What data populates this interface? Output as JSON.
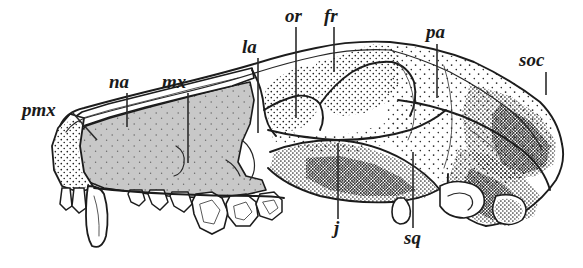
{
  "figure": {
    "kind": "scientific-illustration",
    "background_color": "#ffffff",
    "ink_color": "#1c1c1c",
    "shaded_bone_color": "#c8c8c8",
    "width": 583,
    "height": 268
  },
  "labels": [
    {
      "id": "pmx",
      "text": "pmx",
      "meaning": "premaxilla",
      "text_x": 22,
      "text_y": 116,
      "anchor": "start",
      "font_size": 19,
      "leader": {
        "type": "diagonal",
        "x1": 72,
        "y1": 112,
        "x2": 97,
        "y2": 140
      }
    },
    {
      "id": "na",
      "text": "na",
      "meaning": "nasal",
      "text_x": 109,
      "text_y": 88,
      "anchor": "start",
      "font_size": 19,
      "leader": {
        "type": "vertical",
        "x1": 127,
        "y1": 93,
        "x2": 127,
        "y2": 127
      }
    },
    {
      "id": "mx",
      "text": "mx",
      "meaning": "maxilla",
      "text_x": 162,
      "text_y": 88,
      "anchor": "start",
      "font_size": 19,
      "leader": {
        "type": "vertical",
        "x1": 188,
        "y1": 93,
        "x2": 188,
        "y2": 163
      }
    },
    {
      "id": "la",
      "text": "la",
      "meaning": "lacrimal",
      "text_x": 242,
      "text_y": 53,
      "anchor": "start",
      "font_size": 19,
      "leader": {
        "type": "vertical",
        "x1": 258,
        "y1": 58,
        "x2": 258,
        "y2": 133
      }
    },
    {
      "id": "or",
      "text": "or",
      "meaning": "orbit",
      "text_x": 285,
      "text_y": 22,
      "anchor": "start",
      "font_size": 19,
      "leader": {
        "type": "vertical",
        "x1": 296,
        "y1": 27,
        "x2": 296,
        "y2": 118
      }
    },
    {
      "id": "fr",
      "text": "fr",
      "meaning": "frontal",
      "text_x": 324,
      "text_y": 22,
      "anchor": "start",
      "font_size": 19,
      "leader": {
        "type": "vertical",
        "x1": 334,
        "y1": 27,
        "x2": 334,
        "y2": 72
      }
    },
    {
      "id": "pa",
      "text": "pa",
      "meaning": "parietal",
      "text_x": 426,
      "text_y": 38,
      "anchor": "start",
      "font_size": 19,
      "leader": {
        "type": "vertical",
        "x1": 437,
        "y1": 44,
        "x2": 437,
        "y2": 98
      }
    },
    {
      "id": "soc",
      "text": "soc",
      "meaning": "supraoccipital",
      "text_x": 519,
      "text_y": 66,
      "anchor": "start",
      "font_size": 19,
      "leader": {
        "type": "vertical",
        "x1": 546,
        "y1": 72,
        "x2": 546,
        "y2": 95
      }
    },
    {
      "id": "j",
      "text": "j",
      "meaning": "jugal",
      "text_x": 334,
      "text_y": 234,
      "anchor": "start",
      "font_size": 19,
      "leader": {
        "type": "vertical",
        "x1": 338,
        "y1": 143,
        "x2": 338,
        "y2": 219
      }
    },
    {
      "id": "sq",
      "text": "sq",
      "meaning": "squamosal",
      "text_x": 404,
      "text_y": 244,
      "anchor": "start",
      "font_size": 19,
      "leader": {
        "type": "vertical",
        "x1": 413,
        "y1": 152,
        "x2": 413,
        "y2": 228
      }
    }
  ]
}
